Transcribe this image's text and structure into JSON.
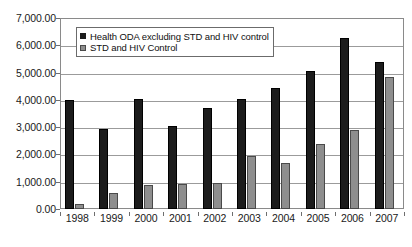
{
  "chart_data": {
    "type": "bar",
    "title": "",
    "subtitle": "",
    "xlabel": "",
    "ylabel": "",
    "categories": [
      "1998",
      "1999",
      "2000",
      "2001",
      "2002",
      "2003",
      "2004",
      "2005",
      "2006",
      "2007"
    ],
    "series": [
      {
        "name": "Health ODA excluding STD and HIV control",
        "color": "#1c1c1c",
        "values": [
          4000,
          2950,
          4050,
          3030,
          3700,
          4030,
          4440,
          5070,
          6250,
          5370
        ]
      },
      {
        "name": "STD and HIV Control",
        "color": "#8e8e8e",
        "values": [
          200,
          580,
          870,
          900,
          950,
          1930,
          1680,
          2400,
          2900,
          4820
        ]
      }
    ],
    "ylim": [
      0,
      7000
    ],
    "ytick_values": [
      0,
      1000,
      2000,
      3000,
      4000,
      5000,
      6000,
      7000
    ],
    "ytick_labels": [
      "0.00",
      "1,000.00",
      "2,000.00",
      "3,000.00",
      "4,000.00",
      "5,000.00",
      "6,000.00",
      "7,000.00"
    ],
    "grid": true,
    "grid_axis": "y",
    "legend_position": "top-left-inside",
    "legend_entries": [
      "Health ODA excluding STD and HIV control",
      "STD and HIV Control"
    ]
  }
}
